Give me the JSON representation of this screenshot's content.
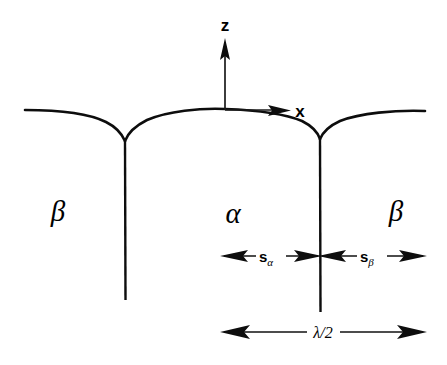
{
  "figure": {
    "type": "schematic-diagram",
    "background_color": "#ffffff",
    "line_color": "#0d0d0d"
  },
  "axes": {
    "vertical": {
      "label": "z",
      "direction": "up",
      "origin_x": 225,
      "origin_y": 110,
      "tip_y": 40
    },
    "horizontal": {
      "label": "x",
      "direction": "right",
      "origin_x": 225,
      "origin_y": 110,
      "tip_x": 290
    }
  },
  "phase_labels": [
    {
      "name": "beta-left",
      "text": "β",
      "x": 58,
      "y": 212
    },
    {
      "name": "alpha-center",
      "text": "α",
      "x": 233,
      "y": 214
    },
    {
      "name": "beta-right",
      "text": "β",
      "x": 396,
      "y": 212
    }
  ],
  "surface_profile": {
    "left_edge_x": 25,
    "right_edge_x": 425,
    "surface_y": 110,
    "cusp_left": {
      "x": 125,
      "y": 141
    },
    "cusp_right": {
      "x": 320,
      "y": 139
    },
    "arch_apex_y": 109
  },
  "grain_boundaries": [
    {
      "name": "boundary-left",
      "x": 125,
      "y_top": 141,
      "y_bottom": 300
    },
    {
      "name": "boundary-right",
      "x": 320,
      "y_top": 139,
      "y_bottom": 312
    }
  ],
  "dimensions": [
    {
      "name": "s-alpha",
      "symbol": "s",
      "subscript": "α",
      "x_start": 222,
      "x_end": 320,
      "y": 256,
      "label_x": 271
    },
    {
      "name": "s-beta",
      "symbol": "s",
      "subscript": "β",
      "x_start": 320,
      "x_end": 425,
      "y": 256,
      "label_x": 372
    },
    {
      "name": "half-wavelength",
      "symbol": "λ/2",
      "subscript": "",
      "x_start": 222,
      "x_end": 425,
      "y": 332,
      "label_x": 323
    }
  ]
}
